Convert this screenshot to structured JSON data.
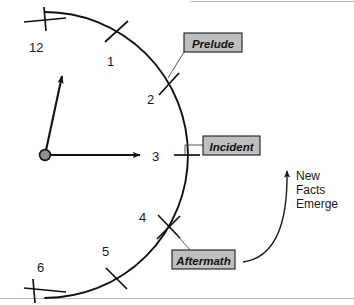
{
  "figure": {
    "background_color": "#ffffff",
    "width": 354,
    "height": 305
  },
  "clock": {
    "center": {
      "x": 45,
      "y": 155
    },
    "radius": 143,
    "numerals": [
      {
        "label": "12",
        "hour": 12,
        "x": 35,
        "y": 48
      },
      {
        "label": "1",
        "hour": 1,
        "x": 110,
        "y": 62
      },
      {
        "label": "2",
        "hour": 2,
        "x": 151,
        "y": 100
      },
      {
        "label": "3",
        "hour": 3,
        "x": 155,
        "y": 160
      },
      {
        "label": "4",
        "hour": 4,
        "x": 142,
        "y": 219
      },
      {
        "label": "5",
        "hour": 5,
        "x": 106,
        "y": 252
      },
      {
        "label": "6",
        "hour": 6,
        "x": 41,
        "y": 269
      }
    ],
    "hour_hand": {
      "points_to": "between 12 and 1",
      "tip_x": 63,
      "tip_y": 72
    },
    "minute_hand": {
      "points_to": "3",
      "tip_x": 146,
      "tip_y": 155
    },
    "hub_color": "#8f8f8f"
  },
  "phase_boxes": [
    {
      "id": "prelude",
      "label": "Prelude",
      "x": 184,
      "y": 33,
      "width": 58,
      "height": 19,
      "fill": "#bfbfbf",
      "attached_to_hour": 2
    },
    {
      "id": "incident",
      "label": "Incident",
      "x": 203,
      "y": 136,
      "width": 57,
      "height": 19,
      "fill": "#bfbfbf",
      "attached_to_hour": 3
    },
    {
      "id": "aftermath",
      "label": "Aftermath",
      "x": 172,
      "y": 250,
      "width": 63,
      "height": 19,
      "fill": "#bfbfbf",
      "attached_to_hour": 4
    }
  ],
  "annotation": {
    "id": "new-facts-emerge",
    "lines": [
      "New",
      "Facts",
      "Emerge"
    ],
    "x": 296,
    "y": 176,
    "arrow_direction": "upward curve from Aftermath toward Incident"
  }
}
